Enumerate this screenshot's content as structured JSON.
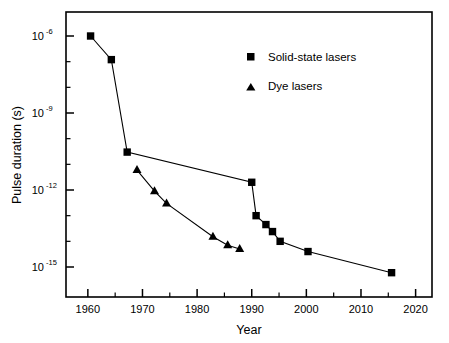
{
  "chart_data": {
    "type": "line",
    "title": "",
    "xlabel": "Year",
    "ylabel": "Pulse duration (s)",
    "yscale": "log",
    "xlim": [
      1956,
      2023
    ],
    "ylim": [
      1e-16,
      5e-06
    ],
    "grid": false,
    "legend_position": "top-right",
    "x_ticks": [
      "1960",
      "1970",
      "1980",
      "1990",
      "2000",
      "2010",
      "2020"
    ],
    "x_tick_values": [
      1960,
      1970,
      1980,
      1990,
      2000,
      2010,
      2020
    ],
    "x_minor_ticks": [
      1965,
      1975,
      1985,
      1995,
      2005,
      2015
    ],
    "y_ticks": [
      "10",
      "10",
      "10",
      "10"
    ],
    "y_tick_exponents": [
      "-6",
      "-9",
      "-12",
      "-15"
    ],
    "y_tick_values": [
      1e-06,
      1e-09,
      1e-12,
      1e-15
    ],
    "y_minor_tick_values": [
      1e-07,
      1e-08,
      1e-10,
      1e-11,
      1e-13,
      1e-14
    ],
    "series": [
      {
        "name": "Solid-state lasers",
        "marker": "square",
        "color": "#000000",
        "points": [
          {
            "x": 1960.5,
            "y": 1e-06
          },
          {
            "x": 1964.3,
            "y": 1.2e-07
          },
          {
            "x": 1967.2,
            "y": 3e-11
          },
          {
            "x": 1990.0,
            "y": 2e-12
          },
          {
            "x": 1990.8,
            "y": 1e-13
          },
          {
            "x": 1992.6,
            "y": 4.5e-14
          },
          {
            "x": 1993.8,
            "y": 2.4e-14
          },
          {
            "x": 1995.2,
            "y": 1e-14
          },
          {
            "x": 2000.3,
            "y": 4e-15
          },
          {
            "x": 2015.6,
            "y": 6e-16
          }
        ]
      },
      {
        "name": "Dye lasers",
        "marker": "triangle",
        "color": "#000000",
        "points": [
          {
            "x": 1969.0,
            "y": 6e-12
          },
          {
            "x": 1972.2,
            "y": 9e-13
          },
          {
            "x": 1974.4,
            "y": 3e-13
          },
          {
            "x": 1982.9,
            "y": 1.5e-14
          },
          {
            "x": 1985.6,
            "y": 7e-15
          },
          {
            "x": 1987.8,
            "y": 5e-15
          }
        ]
      }
    ]
  },
  "legend": {
    "entries": [
      {
        "label": "Solid-state lasers",
        "marker": "square"
      },
      {
        "label": "Dye lasers",
        "marker": "triangle"
      }
    ]
  },
  "axes": {
    "x_title": "Year",
    "y_title": "Pulse duration (s)"
  }
}
